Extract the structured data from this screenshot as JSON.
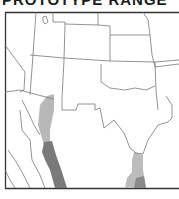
{
  "title": "PROTOTYPE RANGE",
  "map": {
    "region": "Southwestern United States and northern Mexico",
    "colors": {
      "background": "#ffffff",
      "frame": "#333333",
      "borders": "#777777",
      "range_light": "#b8b8b8",
      "range_dark": "#7a7a7a"
    },
    "legend": []
  }
}
